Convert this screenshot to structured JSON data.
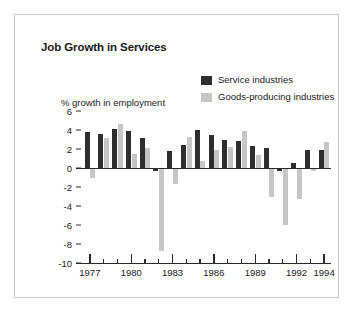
{
  "figure": {
    "border_color": "#c9c9c9",
    "background": "#ffffff"
  },
  "chart_data": {
    "type": "bar",
    "title": "Job Growth in Services",
    "xlabel": "",
    "ylabel": "% growth in employment",
    "ylim": [
      -10,
      6
    ],
    "yticks": [
      6,
      4,
      2,
      0,
      -2,
      -4,
      -6,
      -8,
      -10
    ],
    "ytick_labels": [
      "6",
      "4",
      "2",
      "0",
      "-2",
      "-4",
      "-6",
      "-8",
      "-10"
    ],
    "grid": false,
    "legend_position": "top-right",
    "categories": [
      "1977",
      "1978",
      "1979",
      "1980",
      "1981",
      "1982",
      "1983",
      "1984",
      "1985",
      "1986",
      "1987",
      "1988",
      "1989",
      "1990",
      "1991",
      "1992",
      "1993",
      "1994"
    ],
    "xtick_labels": [
      "1977",
      "1980",
      "1983",
      "1986",
      "1989",
      "1992",
      "1994"
    ],
    "xtick_label_years": [
      1977,
      1980,
      1983,
      1986,
      1989,
      1992,
      1994
    ],
    "series": [
      {
        "name": "Service industries",
        "color": "#2e2e2e",
        "values": [
          3.8,
          3.6,
          4.1,
          3.85,
          3.2,
          -0.3,
          1.75,
          2.4,
          4.0,
          3.5,
          2.9,
          2.85,
          2.3,
          2.1,
          -0.3,
          0.5,
          1.9,
          1.85
        ]
      },
      {
        "name": "Goods-producing industries",
        "color": "#c6c6c6",
        "values": [
          -1.1,
          3.2,
          4.6,
          1.5,
          2.1,
          -8.7,
          -1.7,
          3.25,
          0.7,
          1.9,
          2.25,
          3.85,
          1.4,
          -3.0,
          -6.0,
          -3.3,
          -0.3,
          2.7
        ]
      }
    ]
  },
  "legend": {
    "items": [
      {
        "label": "Service industries",
        "color": "#2e2e2e"
      },
      {
        "label": "Goods-producing industries",
        "color": "#c6c6c6"
      }
    ]
  }
}
